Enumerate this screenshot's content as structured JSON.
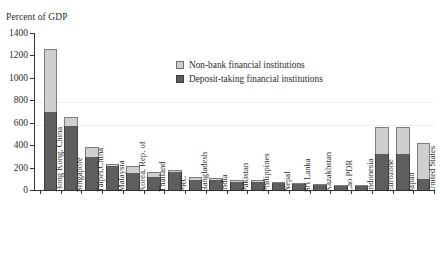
{
  "chart_data": {
    "type": "bar",
    "subtype": "stacked-vertical",
    "title": "",
    "xlabel": "",
    "ylabel": "Percent of GDP",
    "ylim": [
      0,
      1400
    ],
    "yticks": [
      0,
      200,
      400,
      600,
      800,
      1000,
      1200,
      1400
    ],
    "grid": false,
    "legend_position": "upper-center",
    "categories": [
      "Hong Kong, China",
      "Singapore",
      "Taipei,China",
      "Malaysia",
      "Korea, Rep. of",
      "Thailand",
      "PRC",
      "Bangladesh",
      "India",
      "Pakistan",
      "Philippines",
      "Nepal",
      "Sri Lanka",
      "Kazakhstan",
      "Lao PDR",
      "Indonesia",
      "Eurozone",
      "Japan",
      "United States"
    ],
    "series": [
      {
        "name": "Deposit-taking financial institutions",
        "color": "#5e5e5e",
        "values": [
          700,
          575,
          295,
          215,
          150,
          120,
          165,
          90,
          85,
          75,
          70,
          60,
          55,
          45,
          40,
          35,
          320,
          320,
          95
        ]
      },
      {
        "name": "Non-bank financial institutions",
        "color": "#cfcfcf",
        "values": [
          555,
          75,
          85,
          15,
          65,
          45,
          15,
          25,
          25,
          15,
          15,
          12,
          10,
          8,
          5,
          5,
          240,
          240,
          325
        ]
      }
    ],
    "totals": [
      1255,
      650,
      380,
      230,
      215,
      165,
      180,
      115,
      110,
      90,
      85,
      72,
      65,
      53,
      45,
      40,
      560,
      560,
      420
    ]
  },
  "legend": {
    "items": [
      {
        "label": "Non-bank financial institutions",
        "key": "nonbank"
      },
      {
        "label": "Deposit-taking financial institutions",
        "key": "deposit"
      }
    ]
  },
  "axis": {
    "y_title": "Percent of GDP"
  }
}
